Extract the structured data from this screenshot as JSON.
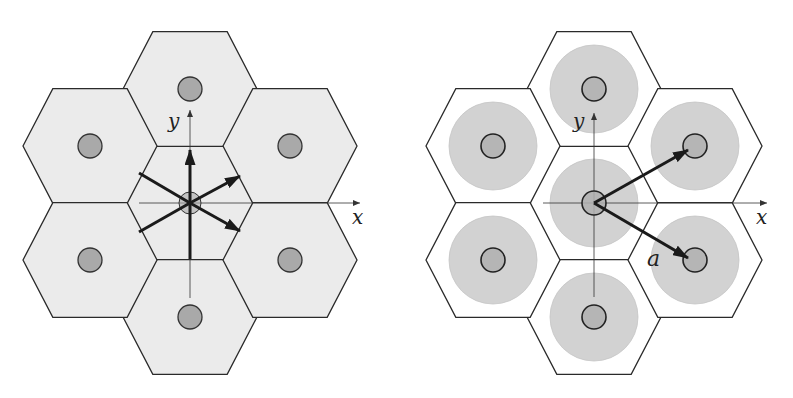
{
  "figure": {
    "panels": [
      {
        "id": "left",
        "description": "Hexagonal lattice of 7 shaded hexagonal cells, each with a small atom circle at its center; central cell shows six vectors from origin",
        "center": [
          190,
          203
        ],
        "hex_radius": 67,
        "hex_fill": "#ebebeb",
        "atom_fill": "#a9a9a9",
        "axis_labels": {
          "x": "x",
          "y": "y"
        },
        "cells": [
          {
            "cx": 190,
            "cy": 203
          },
          {
            "cx": 190,
            "cy": 89
          },
          {
            "cx": 190,
            "cy": 317
          },
          {
            "cx": 90,
            "cy": 146
          },
          {
            "cx": 90,
            "cy": 260
          },
          {
            "cx": 290,
            "cy": 146
          },
          {
            "cx": 290,
            "cy": 260
          }
        ],
        "vectors": [
          {
            "to": [
              190,
              150
            ],
            "arrowhead": true
          },
          {
            "to": [
              240,
              176
            ],
            "arrowhead": true
          },
          {
            "to": [
              240,
              231
            ],
            "arrowhead": true
          },
          {
            "to": [
              139,
              173
            ],
            "arrowhead": false
          },
          {
            "to": [
              139,
              232
            ],
            "arrowhead": false
          },
          {
            "to": [
              190,
              259
            ],
            "arrowhead": false
          }
        ]
      },
      {
        "id": "right",
        "description": "Hexagonal lattice of 7 white hexagonal cells, each containing a large gray disc and small atom circle; two lattice vectors from origin",
        "center": [
          594,
          203
        ],
        "hex_radius": 67,
        "hex_fill": "#ffffff",
        "disc_fill": "#d2d2d2",
        "disc_radius": 44,
        "atom_fill": "#b0b0b0",
        "axis_labels": {
          "x": "x",
          "y": "y"
        },
        "vector_label": "a",
        "cells": [
          {
            "cx": 594,
            "cy": 203
          },
          {
            "cx": 594,
            "cy": 89
          },
          {
            "cx": 594,
            "cy": 317
          },
          {
            "cx": 493,
            "cy": 146
          },
          {
            "cx": 493,
            "cy": 260
          },
          {
            "cx": 695,
            "cy": 146
          },
          {
            "cx": 695,
            "cy": 260
          }
        ],
        "vectors": [
          {
            "to": [
              688,
              150
            ],
            "arrowhead": true
          },
          {
            "to": [
              688,
              258
            ],
            "arrowhead": true
          }
        ]
      }
    ]
  }
}
